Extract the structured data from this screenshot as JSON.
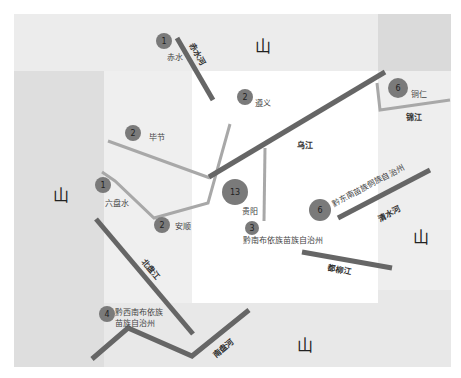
{
  "colors": {
    "background": "#ffffff",
    "mountain_band_light": "#ebebeb",
    "mountain_band_dark": "#dcdcdc",
    "corner_dark": "#d6d6d6",
    "inner_light": "#f1f1f1",
    "major_river": "#666666",
    "minor_river": "#a8a8a8",
    "city_circle": "#7a7a7a"
  },
  "mountains": [
    {
      "id": "north",
      "label": "山",
      "x": 262,
      "y": 48
    },
    {
      "id": "west",
      "label": "山",
      "x": 60,
      "y": 196
    },
    {
      "id": "east",
      "label": "山",
      "x": 420,
      "y": 240
    },
    {
      "id": "south",
      "label": "山",
      "x": 305,
      "y": 347
    }
  ],
  "cities": [
    {
      "id": "chishui",
      "count": "1",
      "name": "赤水",
      "cx": 164,
      "cy": 41,
      "r": 8
    },
    {
      "id": "zunyi",
      "count": "2",
      "name": "遵义",
      "cx": 245,
      "cy": 97,
      "r": 8
    },
    {
      "id": "tongren",
      "count": "6",
      "name": "铜仁",
      "cx": 398,
      "cy": 88,
      "r": 10
    },
    {
      "id": "bijie",
      "count": "2",
      "name": "毕节",
      "cx": 133,
      "cy": 133,
      "r": 8
    },
    {
      "id": "liupanshui",
      "count": "1",
      "name": "六盘水",
      "cx": 103,
      "cy": 185,
      "r": 8
    },
    {
      "id": "anshun",
      "count": "2",
      "name": "安顺",
      "cx": 162,
      "cy": 225,
      "r": 8
    },
    {
      "id": "guiyang",
      "count": "13",
      "name": "贵阳",
      "cx": 235,
      "cy": 192,
      "r": 13
    },
    {
      "id": "qiannan",
      "count": "3",
      "name": "黔南布依族苗族自治州",
      "cx": 252,
      "cy": 228,
      "r": 7
    },
    {
      "id": "qiandongnan",
      "count": "6",
      "name": "黔东南苗族侗族自治州",
      "cx": 320,
      "cy": 210,
      "r": 11
    },
    {
      "id": "qianxinan",
      "count": "4",
      "name_line1": "黔西南布依族",
      "name_line2": "苗族自治州",
      "cx": 107,
      "cy": 314,
      "r": 8
    }
  ],
  "rivers": [
    {
      "id": "chishui-he",
      "label": "赤水河"
    },
    {
      "id": "wujiang",
      "label": "乌江"
    },
    {
      "id": "jinjiang",
      "label": "锦江"
    },
    {
      "id": "qingshui-he",
      "label": "清水河"
    },
    {
      "id": "duliujiang",
      "label": "都柳江"
    },
    {
      "id": "beipanjiang",
      "label": "北盘江"
    },
    {
      "id": "nanpan-he",
      "label": "南盘河"
    }
  ]
}
